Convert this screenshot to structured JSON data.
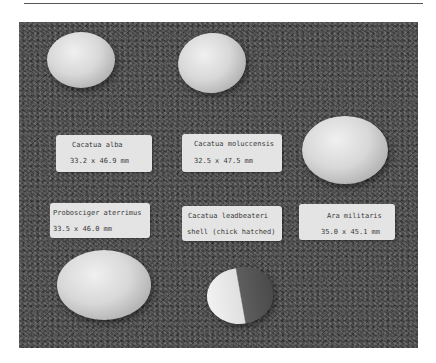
{
  "figure": {
    "specimens": [
      {
        "species": "Cacatua alba",
        "measurement": "33.2 x 46.9 mm"
      },
      {
        "species": "Cacatua moluccensis",
        "measurement": "32.5 x 47.5 mm"
      },
      {
        "species": "Probosciger aterrimus",
        "measurement": "33.5 x 46.0 mm"
      },
      {
        "species": "Cacatua leadbeateri",
        "measurement": "shell (chick hatched)"
      },
      {
        "species": "Ara militaris",
        "measurement": "35.0 x 45.1 mm"
      }
    ]
  }
}
